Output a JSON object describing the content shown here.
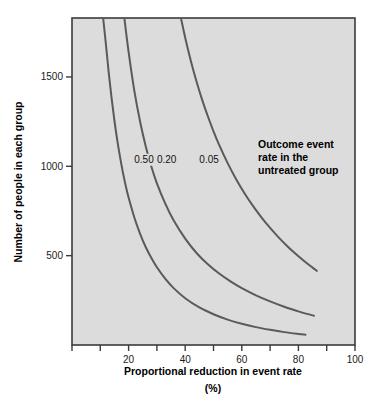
{
  "chart_data": {
    "type": "line",
    "title": "",
    "subtitle": "",
    "xlabel": "Proportional reduction in event rate",
    "xlabel_units": "(%)",
    "ylabel": "Number of people in each group",
    "xlim": [
      0,
      100
    ],
    "ylim": [
      0,
      1830
    ],
    "grid": false,
    "legend_position": "inline-annotation",
    "annotation": {
      "line1": "Outcome event",
      "line2": "rate in the",
      "line3": "untreated group"
    },
    "xticks": [
      0,
      10,
      20,
      30,
      40,
      50,
      60,
      70,
      80,
      90,
      100
    ],
    "xtick_labels": [
      "",
      "",
      "20",
      "",
      "40",
      "",
      "60",
      "",
      "80",
      "",
      "100"
    ],
    "yticks": [
      500,
      1000,
      1500
    ],
    "ytick_labels": [
      "500",
      "1000",
      "1500"
    ],
    "series": [
      {
        "name": "0.50",
        "label": "0.50",
        "label_x": 22,
        "label_y": 1020,
        "color": "#5a5a5a",
        "points": [
          [
            11.0,
            1830
          ],
          [
            12.0,
            1680
          ],
          [
            13.0,
            1520
          ],
          [
            14.0,
            1380
          ],
          [
            15.0,
            1255
          ],
          [
            16.0,
            1145
          ],
          [
            17.0,
            1050
          ],
          [
            18.0,
            965
          ],
          [
            19.0,
            890
          ],
          [
            20.0,
            825
          ],
          [
            22.0,
            715
          ],
          [
            24.0,
            625
          ],
          [
            26.0,
            550
          ],
          [
            28.0,
            488
          ],
          [
            30.0,
            435
          ],
          [
            33.0,
            370
          ],
          [
            36.0,
            317
          ],
          [
            40.0,
            262
          ],
          [
            45.0,
            210
          ],
          [
            50.0,
            172
          ],
          [
            55.0,
            142
          ],
          [
            60.0,
            119
          ],
          [
            65.0,
            100
          ],
          [
            70.0,
            85
          ],
          [
            75.0,
            72
          ],
          [
            80.0,
            62
          ],
          [
            82.5,
            58
          ]
        ]
      },
      {
        "name": "0.20",
        "label": "0.20",
        "label_x": 30,
        "label_y": 1020,
        "color": "#5a5a5a",
        "points": [
          [
            18.5,
            1830
          ],
          [
            20.0,
            1640
          ],
          [
            22.0,
            1425
          ],
          [
            24.0,
            1255
          ],
          [
            26.0,
            1115
          ],
          [
            28.0,
            1000
          ],
          [
            30.0,
            905
          ],
          [
            33.0,
            790
          ],
          [
            36.0,
            695
          ],
          [
            40.0,
            595
          ],
          [
            44.0,
            515
          ],
          [
            48.0,
            452
          ],
          [
            52.0,
            400
          ],
          [
            56.0,
            356
          ],
          [
            60.0,
            318
          ],
          [
            65.0,
            278
          ],
          [
            70.0,
            244
          ],
          [
            75.0,
            214
          ],
          [
            80.0,
            188
          ],
          [
            83.0,
            174
          ],
          [
            85.5,
            164
          ]
        ]
      },
      {
        "name": "0.05",
        "label": "0.05",
        "label_x": 45,
        "label_y": 1020,
        "color": "#5a5a5a",
        "points": [
          [
            38.5,
            1830
          ],
          [
            40.0,
            1720
          ],
          [
            42.0,
            1590
          ],
          [
            44.0,
            1475
          ],
          [
            46.0,
            1372
          ],
          [
            48.0,
            1280
          ],
          [
            50.0,
            1196
          ],
          [
            52.0,
            1120
          ],
          [
            55.0,
            1018
          ],
          [
            58.0,
            928
          ],
          [
            61.0,
            848
          ],
          [
            64.0,
            777
          ],
          [
            67.0,
            713
          ],
          [
            70.0,
            655
          ],
          [
            73.0,
            602
          ],
          [
            76.0,
            554
          ],
          [
            79.0,
            510
          ],
          [
            82.0,
            470
          ],
          [
            85.0,
            433
          ],
          [
            86.5,
            415
          ]
        ]
      }
    ],
    "colors": {
      "plot_background": "#dcdcdc",
      "plot_border": "#3b3b3b",
      "curve": "#5a5a5a",
      "text": "#000000",
      "page_background": "#ffffff"
    }
  }
}
